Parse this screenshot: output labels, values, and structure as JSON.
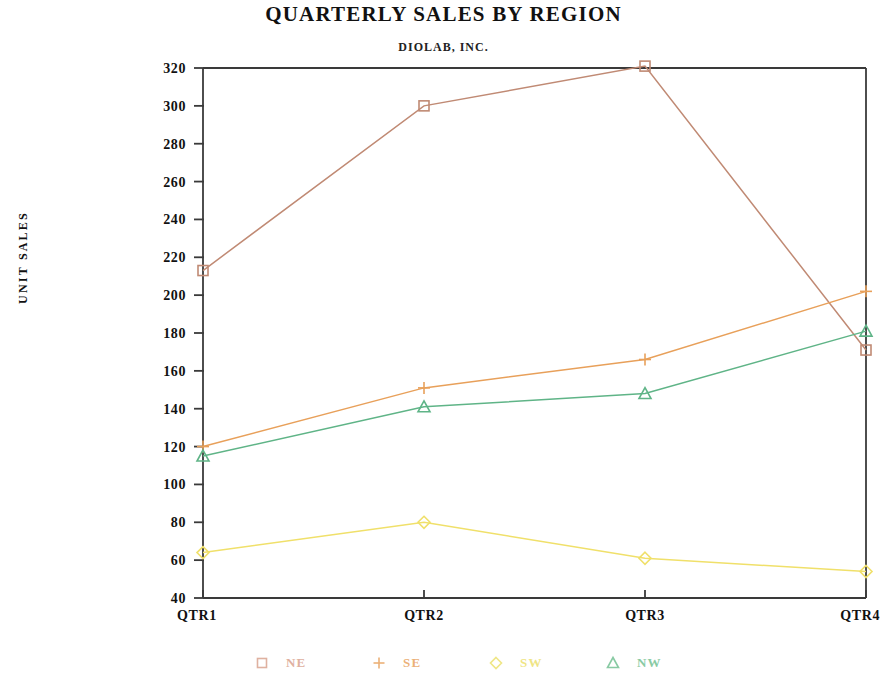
{
  "chart_data": {
    "type": "line",
    "title": "QUARTERLY SALES BY REGION",
    "subtitle": "DIOLAB, INC.",
    "xlabel": "",
    "ylabel": "UNIT SALES",
    "categories": [
      "QTR1",
      "QTR2",
      "QTR3",
      "QTR4"
    ],
    "ylim": [
      40,
      320
    ],
    "ytick_step": 20,
    "yticks": [
      40,
      60,
      80,
      100,
      120,
      140,
      160,
      180,
      200,
      220,
      240,
      260,
      280,
      300,
      320
    ],
    "grid": false,
    "legend_position": "bottom",
    "series": [
      {
        "name": "NE",
        "marker": "square",
        "color": "#c08a74",
        "values": [
          213,
          300,
          321,
          171
        ]
      },
      {
        "name": "SE",
        "marker": "plus",
        "color": "#e8a05a",
        "values": [
          120,
          151,
          166,
          202
        ]
      },
      {
        "name": "SW",
        "marker": "diamond",
        "color": "#f0e06a",
        "values": [
          64,
          80,
          61,
          54
        ]
      },
      {
        "name": "NW",
        "marker": "triangle",
        "color": "#5fb487",
        "values": [
          115,
          141,
          148,
          181
        ]
      }
    ]
  },
  "legend": {
    "items": [
      {
        "label": "NE",
        "marker": "square",
        "color": "#d9a08c"
      },
      {
        "label": "SE",
        "marker": "plus",
        "color": "#e8a05a"
      },
      {
        "label": "SW",
        "marker": "diamond",
        "color": "#ece06a"
      },
      {
        "label": "NW",
        "marker": "triangle",
        "color": "#6fbf90"
      }
    ]
  },
  "axis": {
    "frame_color": "#3a3a3a",
    "ytick_labels": [
      "320",
      "300",
      "280",
      "260",
      "240",
      "220",
      "200",
      "180",
      "160",
      "140",
      "120",
      "100",
      "80",
      "60",
      "40"
    ],
    "xtick_labels": [
      "QTR1",
      "QTR2",
      "QTR3",
      "QTR4"
    ]
  }
}
